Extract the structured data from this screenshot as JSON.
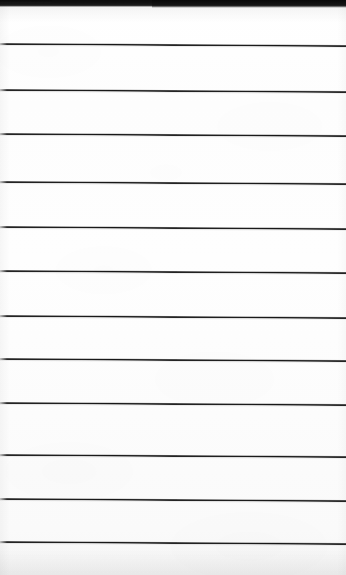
{
  "document": {
    "kind": "scanned-lined-notepad-page",
    "page_width": 346,
    "page_height": 575,
    "page_background_color": "#fdfdfd",
    "rule_color": "#171717",
    "top_band_color": "#0d0d0d",
    "visible_text": "",
    "handwriting_present": "no",
    "note": ""
  },
  "top_band": {
    "label": "",
    "height_px": 7,
    "color": "#0d0d0d"
  },
  "rules": {
    "count": 12,
    "spacing_px": 44,
    "thickness_px": 2,
    "tilt_degrees": 0.35,
    "lines": [
      {
        "index": 1,
        "y": 43,
        "label": ""
      },
      {
        "index": 2,
        "y": 89,
        "label": ""
      },
      {
        "index": 3,
        "y": 133,
        "label": ""
      },
      {
        "index": 4,
        "y": 181,
        "label": ""
      },
      {
        "index": 5,
        "y": 226,
        "label": ""
      },
      {
        "index": 6,
        "y": 270,
        "label": ""
      },
      {
        "index": 7,
        "y": 315,
        "label": ""
      },
      {
        "index": 8,
        "y": 358,
        "label": ""
      },
      {
        "index": 9,
        "y": 402,
        "label": ""
      },
      {
        "index": 10,
        "y": 454,
        "label": ""
      },
      {
        "index": 11,
        "y": 498,
        "label": ""
      },
      {
        "index": 12,
        "y": 541,
        "label": ""
      }
    ]
  },
  "bottom_margin": {
    "height_px": 32,
    "label": ""
  }
}
